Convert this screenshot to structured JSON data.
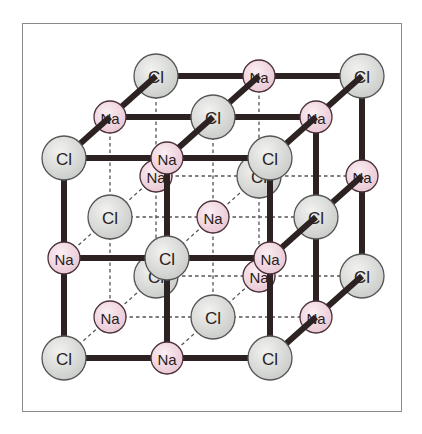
{
  "lattice": {
    "size": 3,
    "rule": "Cl at even (i+j+k), Na at odd",
    "species": {
      "Cl": {
        "label": "Cl",
        "fill": "#dcdedb",
        "stroke": "#555555"
      },
      "Na": {
        "label": "Na",
        "fill": "#f1d6e0",
        "stroke": "#4a3038"
      }
    },
    "bond_color": "#2b2221",
    "hidden_bond_color": "#555555"
  }
}
